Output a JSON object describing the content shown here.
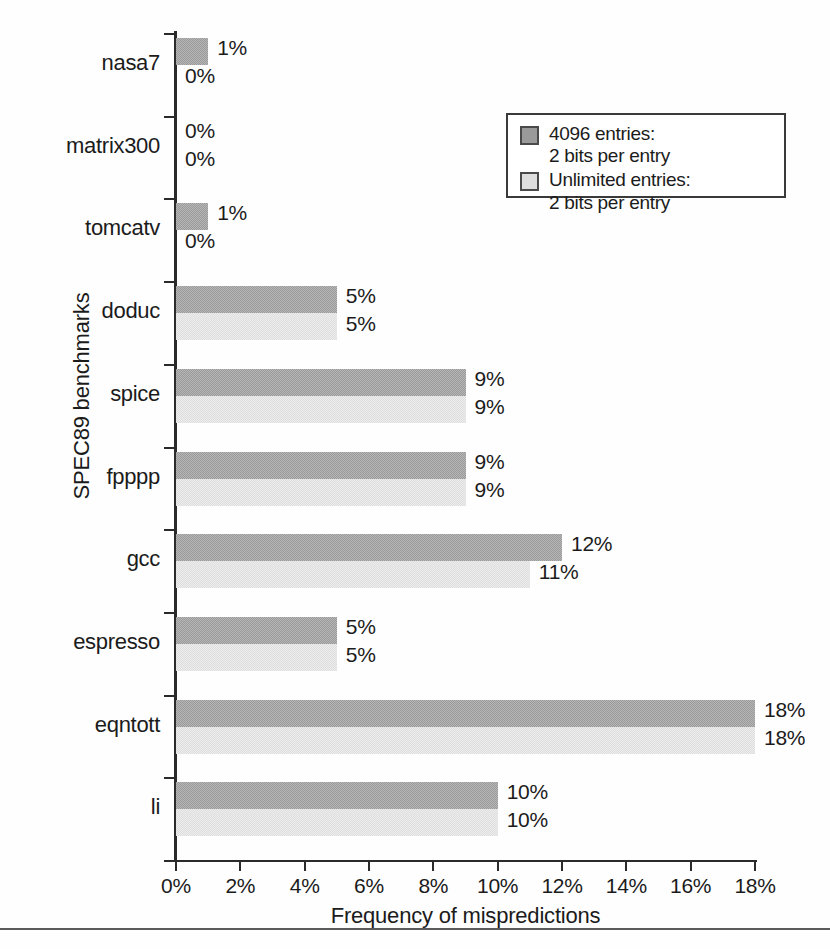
{
  "chart_data": {
    "type": "bar",
    "orientation": "horizontal",
    "title": "",
    "xlabel": "Frequency of mispredictions",
    "ylabel": "SPEC89 benchmarks",
    "xlim": [
      0,
      18
    ],
    "xticks": [
      "0%",
      "2%",
      "4%",
      "6%",
      "8%",
      "10%",
      "12%",
      "14%",
      "16%",
      "18%"
    ],
    "xtick_values": [
      0,
      2,
      4,
      6,
      8,
      10,
      12,
      14,
      16,
      18
    ],
    "grid": false,
    "legend_position": "top-right",
    "categories": [
      "nasa7",
      "matrix300",
      "tomcatv",
      "doduc",
      "spice",
      "fpppp",
      "gcc",
      "espresso",
      "eqntott",
      "li"
    ],
    "series": [
      {
        "name": "4096 entries: 2 bits per entry",
        "color": "#9a9a9a",
        "values": [
          1,
          0,
          1,
          5,
          9,
          9,
          12,
          5,
          18,
          10
        ],
        "labels": [
          "1%",
          "0%",
          "1%",
          "5%",
          "9%",
          "9%",
          "12%",
          "5%",
          "18%",
          "10%"
        ]
      },
      {
        "name": "Unlimited entries: 2 bits per entry",
        "color": "#dedede",
        "values": [
          0,
          0,
          0,
          5,
          9,
          9,
          11,
          5,
          18,
          10
        ],
        "labels": [
          "0%",
          "0%",
          "0%",
          "5%",
          "9%",
          "9%",
          "11%",
          "5%",
          "18%",
          "10%"
        ]
      }
    ]
  },
  "legend": {
    "entries": [
      {
        "line1": "4096 entries:",
        "line2": "2 bits per entry",
        "swatch": "dark-gray-swatch"
      },
      {
        "line1": "Unlimited entries:",
        "line2": "2 bits per entry",
        "swatch": "light-gray-swatch"
      }
    ]
  },
  "caption": {
    "text": ""
  }
}
